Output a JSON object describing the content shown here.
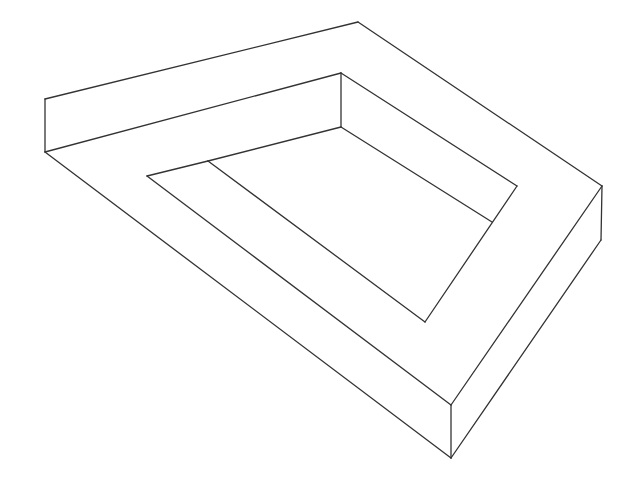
{
  "figure": {
    "stroke_color": "#333333",
    "background": "#ffffff",
    "stroke_width": 1.3,
    "vertices": {
      "outer_left_top": [
        45,
        99
      ],
      "outer_left_bottom": [
        45,
        152
      ],
      "top_apex": [
        358,
        22
      ],
      "inner_corner_top": [
        341,
        73
      ],
      "inner_corner_bottom": [
        341,
        127
      ],
      "right_apex_top": [
        602,
        186
      ],
      "right_apex_bottom": [
        601,
        240
      ],
      "inner_right_top": [
        517,
        186
      ],
      "inner_right_junction": [
        492,
        222
      ],
      "inner_bottom": [
        425,
        322
      ],
      "inner_left_a": [
        147,
        176
      ],
      "inner_left_b": [
        208,
        161
      ],
      "front_top": [
        451,
        405
      ],
      "front_bottom": [
        451,
        458
      ]
    },
    "edges": [
      [
        "outer_left_top",
        "top_apex"
      ],
      [
        "top_apex",
        "right_apex_top"
      ],
      [
        "outer_left_top",
        "outer_left_bottom"
      ],
      [
        "outer_left_bottom",
        "inner_corner_top"
      ],
      [
        "inner_corner_top",
        "inner_corner_bottom"
      ],
      [
        "inner_corner_top",
        "inner_right_top"
      ],
      [
        "inner_corner_bottom",
        "inner_right_junction"
      ],
      [
        "inner_left_b",
        "inner_corner_bottom"
      ],
      [
        "inner_left_a",
        "inner_left_b"
      ],
      [
        "inner_right_top",
        "inner_bottom"
      ],
      [
        "inner_left_b",
        "inner_bottom"
      ],
      [
        "inner_left_a",
        "front_top"
      ],
      [
        "outer_left_bottom",
        "front_bottom"
      ],
      [
        "front_top",
        "front_bottom"
      ],
      [
        "right_apex_top",
        "front_top"
      ],
      [
        "right_apex_top",
        "right_apex_bottom"
      ],
      [
        "right_apex_bottom",
        "front_bottom"
      ]
    ]
  }
}
